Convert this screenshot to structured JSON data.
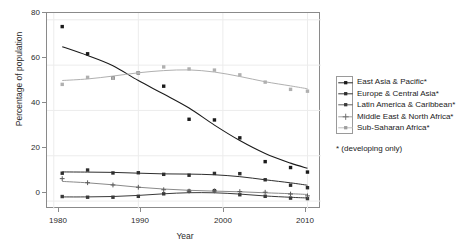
{
  "chart_data": {
    "type": "line",
    "title": "",
    "xlabel": "Year",
    "ylabel": "Percentage of population",
    "xlim": [
      1979.2,
      2011.6
    ],
    "ylim": [
      -3.5,
      83
    ],
    "xticks": [
      1980,
      1990,
      2000,
      2010
    ],
    "yticks": [
      0,
      20,
      40,
      60,
      80
    ],
    "grid": true,
    "legend_position": "right",
    "x": [
      1981,
      1984,
      1987,
      1990,
      1993,
      1996,
      1999,
      2002,
      2005,
      2008,
      2010
    ],
    "series": [
      {
        "name": "East Asia & Pacific*",
        "marker": "square",
        "color": "#1a1a1a",
        "values": [
          77.0,
          65.0,
          54.3,
          56.6,
          50.7,
          36.1,
          35.8,
          27.9,
          17.4,
          14.8,
          12.8
        ]
      },
      {
        "name": "Europe & Central Asia*",
        "marker": "square",
        "color": "#2e2e2e",
        "values": [
          12.3,
          13.7,
          12.4,
          12.5,
          11.8,
          11.4,
          12.2,
          12.1,
          9.4,
          7.0,
          5.9
        ]
      },
      {
        "name": "Latin America & Caribbean*",
        "marker": "square",
        "color": "#3a3a3a",
        "values": [
          2.0,
          1.7,
          1.7,
          2.1,
          3.2,
          4.4,
          4.6,
          2.8,
          2.1,
          1.3,
          1.1
        ]
      },
      {
        "name": "Middle East & North Africa*",
        "marker": "plus",
        "color": "#8a8a8a",
        "values": [
          9.9,
          8.1,
          7.1,
          6.1,
          5.0,
          4.4,
          4.5,
          4.2,
          3.9,
          3.1,
          2.3
        ]
      },
      {
        "name": "Sub-Saharan Africa*",
        "marker": "square",
        "color": "#b0b0b0",
        "values": [
          51.5,
          54.6,
          54.2,
          56.6,
          59.2,
          58.3,
          57.8,
          55.7,
          52.5,
          49.3,
          48.5
        ]
      }
    ],
    "legend_entries": [
      "East Asia & Pacific*",
      "Europe & Central Asia*",
      "Latin America & Caribbean*",
      "Middle East & North Africa*",
      "Sub-Saharan Africa*"
    ],
    "footnote": "* (developing only)",
    "tick_labels": {
      "y": [
        "0",
        "20",
        "40",
        "60",
        "80"
      ],
      "x": [
        "1980",
        "1990",
        "2000",
        "2010"
      ]
    }
  }
}
